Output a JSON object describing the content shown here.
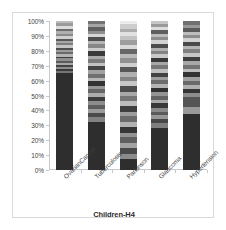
{
  "chart_data": {
    "type": "bar",
    "subtype": "100% stacked bar",
    "title": "",
    "xlabel": "Children-H4",
    "ylabel": "",
    "ylim": [
      0,
      100
    ],
    "grid": false,
    "legend": "none",
    "colorscheme": "grayscale",
    "categories": [
      "OvarianCancer",
      "Tuberculosis",
      "Parkinson",
      "Glaucoma",
      "Hypertension"
    ],
    "ytick_labels": [
      "0%",
      "10%",
      "20%",
      "30%",
      "40%",
      "50%",
      "60%",
      "70%",
      "80%",
      "90%",
      "100%"
    ],
    "ytick_values": [
      0,
      10,
      20,
      30,
      40,
      50,
      60,
      70,
      80,
      90,
      100
    ],
    "series": [
      {
        "name": "OvarianCancer",
        "segments": [
          {
            "value": 67.5,
            "color": "#2e2e2e"
          },
          {
            "value": 1.5,
            "color": "#767676"
          },
          {
            "value": 1.4,
            "color": "#3a3a3a"
          },
          {
            "value": 1.6,
            "color": "#8f8f8f"
          },
          {
            "value": 1.3,
            "color": "#434343"
          },
          {
            "value": 1.8,
            "color": "#a8a8a8"
          },
          {
            "value": 1.4,
            "color": "#5c5c5c"
          },
          {
            "value": 1.5,
            "color": "#909090"
          },
          {
            "value": 1.3,
            "color": "#3d3d3d"
          },
          {
            "value": 1.8,
            "color": "#b5b5b5"
          },
          {
            "value": 1.4,
            "color": "#6a6a6a"
          },
          {
            "value": 1.6,
            "color": "#9c9c9c"
          },
          {
            "value": 1.3,
            "color": "#4e4e4e"
          },
          {
            "value": 1.9,
            "color": "#c4c4c4"
          },
          {
            "value": 1.5,
            "color": "#7d7d7d"
          },
          {
            "value": 1.6,
            "color": "#a5a5a5"
          },
          {
            "value": 1.4,
            "color": "#585858"
          },
          {
            "value": 2.0,
            "color": "#cfcfcf"
          },
          {
            "value": 1.6,
            "color": "#8a8a8a"
          },
          {
            "value": 1.8,
            "color": "#b0b0b0"
          },
          {
            "value": 1.5,
            "color": "#6d6d6d"
          },
          {
            "value": 2.1,
            "color": "#dcdcdc"
          },
          {
            "value": 1.8,
            "color": "#9a9a9a"
          },
          {
            "value": 1.5,
            "color": "#bcbcbc"
          }
        ]
      },
      {
        "name": "Tuberculosis",
        "segments": [
          {
            "value": 31.5,
            "color": "#2e2e2e"
          },
          {
            "value": 3.2,
            "color": "#828282"
          },
          {
            "value": 2.4,
            "color": "#4b4b4b"
          },
          {
            "value": 2.8,
            "color": "#9b9b9b"
          },
          {
            "value": 2.2,
            "color": "#5e5e5e"
          },
          {
            "value": 2.6,
            "color": "#8d8d8d"
          },
          {
            "value": 2.9,
            "color": "#3c3c3c"
          },
          {
            "value": 2.3,
            "color": "#acacac"
          },
          {
            "value": 2.7,
            "color": "#666666"
          },
          {
            "value": 2.1,
            "color": "#979797"
          },
          {
            "value": 3.0,
            "color": "#333333"
          },
          {
            "value": 2.4,
            "color": "#b8b8b8"
          },
          {
            "value": 2.6,
            "color": "#707070"
          },
          {
            "value": 2.2,
            "color": "#a1a1a1"
          },
          {
            "value": 2.8,
            "color": "#454545"
          },
          {
            "value": 2.3,
            "color": "#c2c2c2"
          },
          {
            "value": 2.5,
            "color": "#7b7b7b"
          },
          {
            "value": 2.1,
            "color": "#aaaaaa"
          },
          {
            "value": 2.7,
            "color": "#3a3a3a"
          },
          {
            "value": 2.2,
            "color": "#cccccc"
          },
          {
            "value": 2.4,
            "color": "#868686"
          },
          {
            "value": 2.0,
            "color": "#b4b4b4"
          },
          {
            "value": 2.6,
            "color": "#4f4f4f"
          },
          {
            "value": 2.1,
            "color": "#d6d6d6"
          },
          {
            "value": 2.3,
            "color": "#8f8f8f"
          },
          {
            "value": 2.1,
            "color": "#606060"
          },
          {
            "value": 2.0,
            "color": "#a6a6a6"
          },
          {
            "value": 2.0,
            "color": "#727272"
          }
        ]
      },
      {
        "name": "Parkinson",
        "segments": [
          {
            "value": 7.5,
            "color": "#2e2e2e"
          },
          {
            "value": 3.6,
            "color": "#8b8b8b"
          },
          {
            "value": 4.2,
            "color": "#4a4a4a"
          },
          {
            "value": 3.2,
            "color": "#a3a3a3"
          },
          {
            "value": 3.8,
            "color": "#606060"
          },
          {
            "value": 3.4,
            "color": "#939393"
          },
          {
            "value": 4.0,
            "color": "#363636"
          },
          {
            "value": 3.3,
            "color": "#b2b2b2"
          },
          {
            "value": 3.7,
            "color": "#6b6b6b"
          },
          {
            "value": 3.1,
            "color": "#9c9c9c"
          },
          {
            "value": 4.1,
            "color": "#3f3f3f"
          },
          {
            "value": 3.2,
            "color": "#bdbdbd"
          },
          {
            "value": 3.6,
            "color": "#767676"
          },
          {
            "value": 3.0,
            "color": "#a8a8a8"
          },
          {
            "value": 3.9,
            "color": "#4c4c4c"
          },
          {
            "value": 3.1,
            "color": "#c6c6c6"
          },
          {
            "value": 3.4,
            "color": "#848484"
          },
          {
            "value": 2.9,
            "color": "#b0b0b0"
          },
          {
            "value": 3.6,
            "color": "#575757"
          },
          {
            "value": 3.0,
            "color": "#d0d0d0"
          },
          {
            "value": 3.2,
            "color": "#919191"
          },
          {
            "value": 2.8,
            "color": "#bababa"
          },
          {
            "value": 3.3,
            "color": "#676767"
          },
          {
            "value": 2.9,
            "color": "#dadada"
          },
          {
            "value": 3.1,
            "color": "#9e9e9e"
          },
          {
            "value": 2.7,
            "color": "#c3c3c3"
          },
          {
            "value": 2.9,
            "color": "#e2e2e2"
          },
          {
            "value": 2.5,
            "color": "#acacac"
          },
          {
            "value": 2.8,
            "color": "#cdcdcd"
          },
          {
            "value": 2.2,
            "color": "#ebebeb"
          }
        ]
      },
      {
        "name": "Glaucoma",
        "segments": [
          {
            "value": 29.5,
            "color": "#2e2e2e"
          },
          {
            "value": 3.4,
            "color": "#7e7e7e"
          },
          {
            "value": 2.6,
            "color": "#474747"
          },
          {
            "value": 3.0,
            "color": "#989898"
          },
          {
            "value": 2.4,
            "color": "#5a5a5a"
          },
          {
            "value": 2.8,
            "color": "#8a8a8a"
          },
          {
            "value": 3.1,
            "color": "#383838"
          },
          {
            "value": 2.5,
            "color": "#a9a9a9"
          },
          {
            "value": 2.9,
            "color": "#636363"
          },
          {
            "value": 2.3,
            "color": "#949494"
          },
          {
            "value": 3.2,
            "color": "#313131"
          },
          {
            "value": 2.6,
            "color": "#b5b5b5"
          },
          {
            "value": 2.8,
            "color": "#6d6d6d"
          },
          {
            "value": 2.4,
            "color": "#9e9e9e"
          },
          {
            "value": 3.0,
            "color": "#424242"
          },
          {
            "value": 2.5,
            "color": "#bfbfbf"
          },
          {
            "value": 2.7,
            "color": "#787878"
          },
          {
            "value": 2.3,
            "color": "#a7a7a7"
          },
          {
            "value": 2.9,
            "color": "#383838"
          },
          {
            "value": 2.4,
            "color": "#c9c9c9"
          },
          {
            "value": 2.6,
            "color": "#838383"
          },
          {
            "value": 2.2,
            "color": "#b1b1b1"
          },
          {
            "value": 2.8,
            "color": "#4d4d4d"
          },
          {
            "value": 2.3,
            "color": "#d3d3d3"
          },
          {
            "value": 2.5,
            "color": "#8d8d8d"
          },
          {
            "value": 2.2,
            "color": "#bbbbbb"
          },
          {
            "value": 2.4,
            "color": "#5e5e5e"
          },
          {
            "value": 2.0,
            "color": "#dddddd"
          },
          {
            "value": 2.2,
            "color": "#9a9a9a"
          },
          {
            "value": 2.1,
            "color": "#c6c6c6"
          }
        ]
      },
      {
        "name": "Hypertension",
        "segments": [
          {
            "value": 37.5,
            "color": "#2e2e2e"
          },
          {
            "value": 4.8,
            "color": "#9a9a9a"
          },
          {
            "value": 6.5,
            "color": "#555555"
          },
          {
            "value": 3.0,
            "color": "#8e8e8e"
          },
          {
            "value": 2.6,
            "color": "#353535"
          },
          {
            "value": 2.9,
            "color": "#b0b0b0"
          },
          {
            "value": 2.4,
            "color": "#696969"
          },
          {
            "value": 2.8,
            "color": "#a0a0a0"
          },
          {
            "value": 3.1,
            "color": "#333333"
          },
          {
            "value": 2.5,
            "color": "#bcbcbc"
          },
          {
            "value": 2.7,
            "color": "#747474"
          },
          {
            "value": 2.3,
            "color": "#a8a8a8"
          },
          {
            "value": 3.0,
            "color": "#3e3e3e"
          },
          {
            "value": 2.4,
            "color": "#c7c7c7"
          },
          {
            "value": 2.6,
            "color": "#808080"
          },
          {
            "value": 2.2,
            "color": "#b4b4b4"
          },
          {
            "value": 2.8,
            "color": "#4a4a4a"
          },
          {
            "value": 2.3,
            "color": "#d2d2d2"
          },
          {
            "value": 2.5,
            "color": "#8c8c8c"
          },
          {
            "value": 2.1,
            "color": "#bebebe"
          },
          {
            "value": 2.4,
            "color": "#5b5b5b"
          },
          {
            "value": 2.2,
            "color": "#999999"
          },
          {
            "value": 2.4,
            "color": "#707070"
          }
        ]
      }
    ]
  }
}
